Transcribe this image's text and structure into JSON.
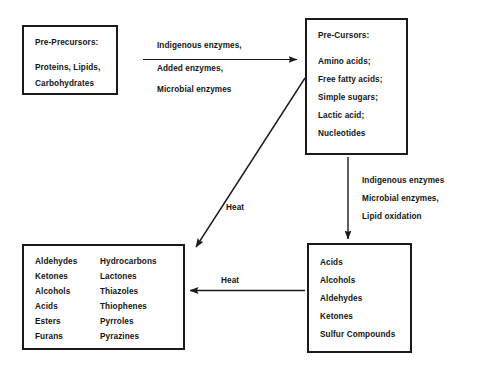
{
  "diagram": {
    "line_color": "#1a1a1a",
    "text_color": "#141414"
  },
  "boxes": {
    "pre_precursors": {
      "heading": "Pre-Precursors:",
      "items": [
        "Proteins, Lipids,",
        "Carbohydrates"
      ]
    },
    "precursors": {
      "heading": "Pre-Cursors:",
      "items": [
        "Amino acids;",
        "Free fatty acids;",
        "Simple sugars;",
        "Lactic acid;",
        "Nucleotides"
      ]
    },
    "volatiles": {
      "column_left": [
        "Aldehydes",
        "Ketones",
        "Alcohols",
        "Acids",
        "Esters",
        "Furans"
      ],
      "column_right": [
        "Hydrocarbons",
        "Lactones",
        "Thiazoles",
        "Thiophenes",
        "Pyrroles",
        "Pyrazines"
      ]
    },
    "products": {
      "items": [
        "Acids",
        "Alcohols",
        "Aldehydes",
        "Ketones",
        "Sulfur Compounds"
      ]
    }
  },
  "arrow_labels": {
    "top": [
      "Indigenous enzymes,",
      "Added enzymes,",
      "Microbial enzymes"
    ],
    "right": [
      "Indigenous enzymes",
      "Microbial enzymes,",
      "Lipid oxidation"
    ],
    "diagonal": "Heat",
    "bottom": "Heat"
  }
}
